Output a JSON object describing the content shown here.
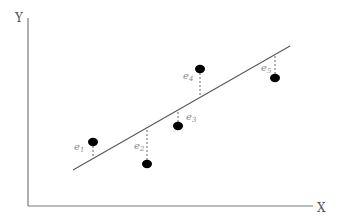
{
  "diagram": {
    "axes": {
      "x_label": "X",
      "y_label": "Y",
      "color": "#7a7a7a"
    },
    "regression_line": {
      "x1": 73,
      "y1": 170,
      "x2": 290,
      "y2": 46,
      "color": "#555555"
    },
    "points": [
      {
        "id": "p1",
        "cx": 93,
        "cy": 142,
        "label": "e",
        "sub": "1",
        "lx": 74,
        "ly": 150,
        "line_y": 158
      },
      {
        "id": "p2",
        "cx": 147,
        "cy": 164,
        "label": "e",
        "sub": "2",
        "lx": 134,
        "ly": 149,
        "line_y": 127
      },
      {
        "id": "p3",
        "cx": 178,
        "cy": 126,
        "label": "e",
        "sub": "3",
        "lx": 186,
        "ly": 120,
        "line_y": 110
      },
      {
        "id": "p4",
        "cx": 200,
        "cy": 69,
        "label": "e",
        "sub": "4",
        "lx": 183,
        "ly": 79,
        "line_y": 97
      },
      {
        "id": "p5",
        "cx": 275,
        "cy": 78,
        "label": "e",
        "sub": "5",
        "lx": 261,
        "ly": 71,
        "line_y": 55
      }
    ],
    "point_color": "#000000",
    "residual_color": "#666666"
  }
}
